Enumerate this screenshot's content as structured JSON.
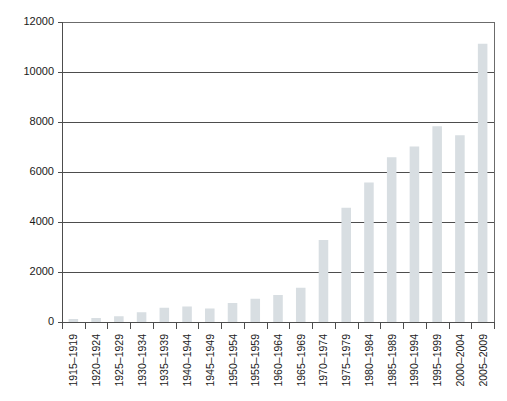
{
  "chart_data": {
    "type": "bar",
    "title": "",
    "subtitle": "",
    "xlabel": "",
    "ylabel": "",
    "ylim": [
      0,
      12000
    ],
    "ytick_step": 2000,
    "yticks": [
      "0",
      "2000",
      "4000",
      "6000",
      "8000",
      "10000",
      "12000"
    ],
    "grid": "horizontal",
    "legend": "none",
    "bar_color": "#d8dee2",
    "axis_color": "#4d4d4d",
    "categories": [
      "1915–1919",
      "1920–1924",
      "1925–1929",
      "1930–1934",
      "1935–1939",
      "1940–1944",
      "1945–1949",
      "1950–1954",
      "1955–1959",
      "1960–1964",
      "1965–1969",
      "1970–1974",
      "1975–1979",
      "1980–1984",
      "1985–1989",
      "1990–1994",
      "1995–1999",
      "2000–2004",
      "2005–2009"
    ],
    "values": [
      120,
      160,
      230,
      390,
      570,
      620,
      540,
      760,
      930,
      1080,
      1370,
      3280,
      4570,
      5580,
      6590,
      7020,
      7830,
      7470,
      11130
    ]
  },
  "plot": {
    "left": 62,
    "right": 494,
    "top": 22,
    "bottom": 322,
    "bar_width_ratio": 0.42
  }
}
